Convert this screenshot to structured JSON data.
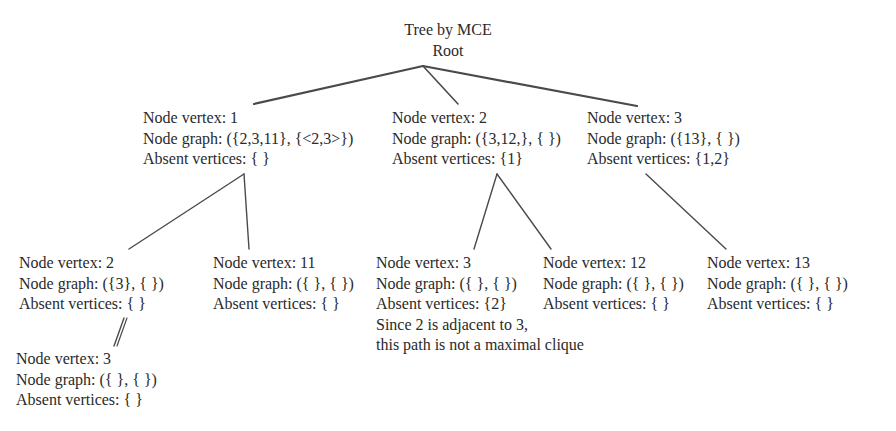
{
  "diagram": {
    "title": "Tree by MCE",
    "root_label": "Root",
    "edge_color": "#4a4a4a",
    "nodes": [
      {
        "id": "n1",
        "vertex_line": "Node vertex: 1",
        "graph_line": "Node graph: ({2,3,11}, {<2,3>})",
        "absent_line": "Absent vertices: { }"
      },
      {
        "id": "n2",
        "vertex_line": "Node vertex: 2",
        "graph_line": "Node graph: ({3,12,}, { })",
        "absent_line": "Absent vertices: {1}"
      },
      {
        "id": "n3",
        "vertex_line": "Node vertex: 3",
        "graph_line": "Node graph: ({13}, { })",
        "absent_line": "Absent vertices: {1,2}"
      },
      {
        "id": "n1_2",
        "vertex_line": "Node vertex: 2",
        "graph_line": "Node graph: ({3}, { })",
        "absent_line": "Absent vertices: { }"
      },
      {
        "id": "n1_11",
        "vertex_line": "Node vertex: 11",
        "graph_line": "Node graph: ({ }, { })",
        "absent_line": "Absent vertices: { }"
      },
      {
        "id": "n2_3",
        "vertex_line": "Node vertex: 3",
        "graph_line": "Node graph: ({ }, { })",
        "absent_line": "Absent vertices: {2}",
        "note_lines": [
          "Since 2 is adjacent to 3,",
          "this path is not a maximal clique"
        ]
      },
      {
        "id": "n2_12",
        "vertex_line": "Node vertex: 12",
        "graph_line": "Node graph: ({ }, { })",
        "absent_line": "Absent vertices: { }"
      },
      {
        "id": "n3_13",
        "vertex_line": "Node vertex: 13",
        "graph_line": "Node graph: ({ }, { })",
        "absent_line": "Absent vertices: { }"
      },
      {
        "id": "n1_2_3",
        "vertex_line": "Node vertex: 3",
        "graph_line": "Node graph: ({ }, { })",
        "absent_line": "Absent vertices: { }"
      }
    ],
    "edges": [
      {
        "from": "root",
        "to": "n1"
      },
      {
        "from": "root",
        "to": "n2"
      },
      {
        "from": "root",
        "to": "n3"
      },
      {
        "from": "n1",
        "to": "n1_2"
      },
      {
        "from": "n1",
        "to": "n1_11"
      },
      {
        "from": "n2",
        "to": "n2_3"
      },
      {
        "from": "n2",
        "to": "n2_12"
      },
      {
        "from": "n3",
        "to": "n3_13"
      },
      {
        "from": "n1_2",
        "to": "n1_2_3"
      }
    ]
  }
}
